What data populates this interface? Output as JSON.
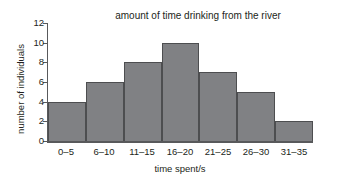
{
  "chart_data": {
    "type": "bar",
    "title": "amount of time drinking from the river",
    "xlabel": "time spent/s",
    "ylabel": "number of individuals",
    "categories": [
      "0–5",
      "6–10",
      "11–15",
      "16–20",
      "21–25",
      "26–30",
      "31–35"
    ],
    "values": [
      4,
      6,
      8,
      10,
      7,
      5,
      2
    ],
    "ylim": [
      0,
      12
    ],
    "yticks": [
      0,
      2,
      4,
      6,
      8,
      10,
      12
    ],
    "ytick_labels": [
      "0",
      "2",
      "4",
      "6",
      "8",
      "10",
      "12"
    ],
    "grid": false,
    "legend": null,
    "bar_color": "#808184",
    "bar_edge_color": "#4d4e50",
    "axis_color": "#58595b",
    "background": "#ffffff",
    "text_color": "#231f20"
  }
}
